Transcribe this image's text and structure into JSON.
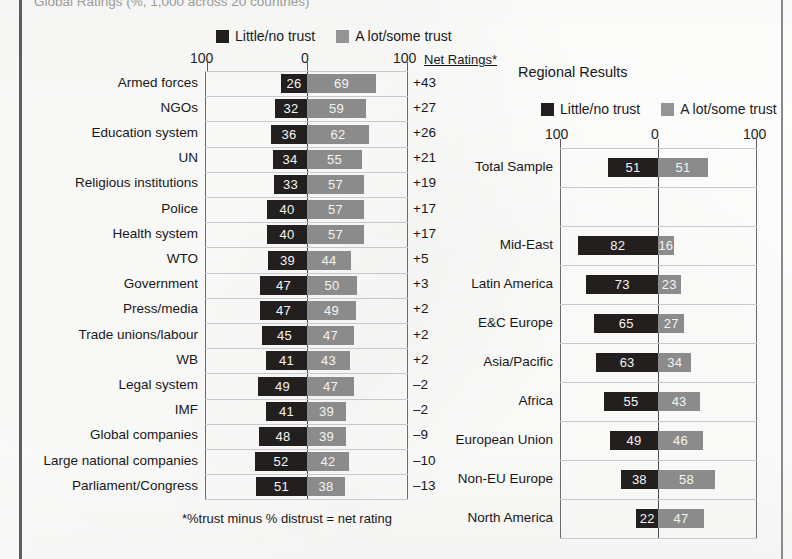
{
  "page": {
    "caption_top": "Global Ratings (%, 1,000 across 20 countries)",
    "footnote": "*%trust minus % distrust = net rating"
  },
  "legend": {
    "dark_label": "Little/no trust",
    "light_label": "A lot/some trust",
    "dark_color": "#231f1f",
    "light_color": "#8b8b8b"
  },
  "left_panel": {
    "net_header": "Net Ratings*",
    "axis": {
      "left": "100",
      "center": "0",
      "right": "100",
      "min": -100,
      "max": 100
    }
  },
  "right_panel": {
    "title": "Regional Results",
    "axis": {
      "left": "100",
      "center": "0",
      "right": "100",
      "min": -100,
      "max": 100
    }
  },
  "chart_data": [
    {
      "type": "bar",
      "title": "Global Ratings",
      "subtitle": "Net Ratings*",
      "orientation": "horizontal",
      "stacked": "diverging",
      "legend": [
        "Little/no trust",
        "A lot/some trust"
      ],
      "legend_position": "top",
      "grid": true,
      "xlabel": "",
      "ylabel": "",
      "xlim": [
        -100,
        100
      ],
      "xticks": [
        -100,
        0,
        100
      ],
      "xticklabels": [
        "100",
        "0",
        "100"
      ],
      "categories": [
        "Armed forces",
        "NGOs",
        "Education system",
        "UN",
        "Religious institutions",
        "Police",
        "Health system",
        "WTO",
        "Government",
        "Press/media",
        "Trade unions/labour",
        "WB",
        "Legal system",
        "IMF",
        "Global companies",
        "Large national companies",
        "Parliament/Congress"
      ],
      "series": [
        {
          "name": "Little/no trust",
          "values": [
            26,
            32,
            36,
            34,
            33,
            40,
            40,
            39,
            47,
            47,
            45,
            41,
            49,
            41,
            48,
            52,
            51
          ]
        },
        {
          "name": "A lot/some trust",
          "values": [
            69,
            59,
            62,
            55,
            57,
            57,
            57,
            44,
            50,
            49,
            47,
            43,
            47,
            39,
            39,
            42,
            38
          ]
        }
      ],
      "net_ratings": [
        "+43",
        "+27",
        "+26",
        "+21",
        "+19",
        "+17",
        "+17",
        "+5",
        "+3",
        "+2",
        "+2",
        "+2",
        "–2",
        "–2",
        "–9",
        "–10",
        "–13"
      ],
      "annotations": [
        "*%trust minus % distrust = net rating"
      ]
    },
    {
      "type": "bar",
      "title": "Regional Results",
      "orientation": "horizontal",
      "stacked": "diverging",
      "legend": [
        "Little/no trust",
        "A lot/some trust"
      ],
      "legend_position": "top",
      "grid": true,
      "xlabel": "",
      "ylabel": "",
      "xlim": [
        -100,
        100
      ],
      "xticks": [
        -100,
        0,
        100
      ],
      "xticklabels": [
        "100",
        "0",
        "100"
      ],
      "categories": [
        "Total Sample",
        "",
        "Mid-East",
        "Latin America",
        "E&C Europe",
        "Asia/Pacific",
        "Africa",
        "European Union",
        "Non-EU Europe",
        "North America"
      ],
      "series": [
        {
          "name": "Little/no trust",
          "values": [
            51,
            null,
            82,
            73,
            65,
            63,
            55,
            49,
            38,
            22
          ]
        },
        {
          "name": "A lot/some trust",
          "values": [
            51,
            null,
            16,
            23,
            27,
            34,
            43,
            46,
            58,
            47
          ]
        }
      ]
    }
  ]
}
